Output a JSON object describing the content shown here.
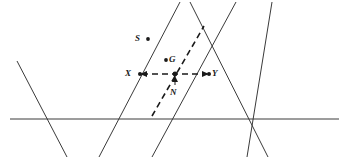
{
  "figure": {
    "background_color": "#ffffff",
    "stroke_color": "#3a3a3a",
    "dash_color": "#1a1a1a",
    "label_color": "#1a1a1a",
    "width": 349,
    "height": 159
  },
  "labels": {
    "S": "S",
    "G": "G",
    "X": "X",
    "Y": "Y",
    "N": "N"
  },
  "points": [
    {
      "name": "S",
      "x": 148,
      "y": 39,
      "label_x": 135,
      "label_y": 34,
      "dot": true
    },
    {
      "name": "G",
      "x": 166,
      "y": 60,
      "label_x": 169,
      "label_y": 55,
      "dot": true
    },
    {
      "name": "X",
      "x": 140,
      "y": 74,
      "label_x": 125,
      "label_y": 69,
      "dot": true
    },
    {
      "name": "Y",
      "x": 209,
      "y": 74,
      "label_x": 212,
      "label_y": 69,
      "dot": true
    },
    {
      "name": "N",
      "x": 174,
      "y": 86,
      "label_x": 170,
      "label_y": 88,
      "dot": false
    },
    {
      "name": "center",
      "x": 175,
      "y": 74,
      "label_x": 0,
      "label_y": 0,
      "dot": true
    }
  ],
  "solid_lines": [
    {
      "name": "horizontal-baseline",
      "x1": 10,
      "y1": 119,
      "x2": 339,
      "y2": 119
    },
    {
      "name": "left-descending-line",
      "x1": 17,
      "y1": 61,
      "x2": 67,
      "y2": 157
    },
    {
      "name": "left-ascending-line",
      "x1": 99,
      "y1": 157,
      "x2": 180,
      "y2": 2
    },
    {
      "name": "mid-ascending-line",
      "x1": 152,
      "y1": 157,
      "x2": 236,
      "y2": 2
    },
    {
      "name": "mid-descending-line",
      "x1": 190,
      "y1": 2,
      "x2": 268,
      "y2": 157
    },
    {
      "name": "right-ascending-line",
      "x1": 247,
      "y1": 157,
      "x2": 272,
      "y2": 2
    }
  ],
  "dashed_lines": [
    {
      "name": "segment-XY",
      "x1": 140,
      "y1": 74,
      "x2": 209,
      "y2": 74
    },
    {
      "name": "diagonal-dashed-line",
      "x1": 152,
      "y1": 116,
      "x2": 204,
      "y2": 26
    }
  ],
  "arrows": [
    {
      "name": "arrow-to-X",
      "from_x": 160,
      "from_y": 74,
      "to_x": 140,
      "to_y": 74
    },
    {
      "name": "arrow-to-Y",
      "from_x": 190,
      "from_y": 74,
      "to_x": 209,
      "to_y": 74
    },
    {
      "name": "arrow-N-to-center",
      "from_x": 175,
      "from_y": 85,
      "to_x": 175,
      "to_y": 77
    }
  ]
}
